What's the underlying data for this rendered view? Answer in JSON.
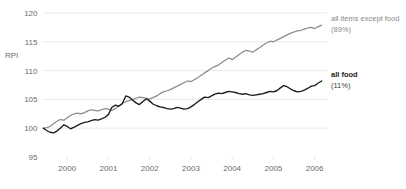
{
  "chart_data": {
    "type": "line",
    "title": "",
    "xlabel": "",
    "ylabel": "RPI",
    "ylim": [
      95,
      120
    ],
    "yticks": [
      95,
      100,
      105,
      110,
      115,
      120
    ],
    "ytick_labels": [
      "95",
      "100",
      "105",
      "110",
      "115",
      "120"
    ],
    "grid": true,
    "grid_axis": "y",
    "xlim": [
      1999.4,
      2006.3
    ],
    "xticks": [
      2000,
      2001,
      2002,
      2003,
      2004,
      2005,
      2006
    ],
    "xtick_labels": [
      "2000",
      "2001",
      "2002",
      "2003",
      "2004",
      "2005",
      "2006"
    ],
    "legend_position": "right-inline",
    "series": [
      {
        "name": "all items except food",
        "sublabel": "(89%)",
        "color": "#8c8c8c",
        "emphasis": false,
        "x": [
          1999.42,
          1999.5,
          1999.58,
          1999.67,
          1999.75,
          1999.83,
          1999.92,
          2000.0,
          2000.08,
          2000.17,
          2000.25,
          2000.33,
          2000.42,
          2000.5,
          2000.58,
          2000.67,
          2000.75,
          2000.83,
          2000.92,
          2001.0,
          2001.08,
          2001.17,
          2001.25,
          2001.33,
          2001.42,
          2001.5,
          2001.58,
          2001.67,
          2001.75,
          2001.83,
          2001.92,
          2002.0,
          2002.08,
          2002.17,
          2002.25,
          2002.33,
          2002.42,
          2002.5,
          2002.58,
          2002.67,
          2002.75,
          2002.83,
          2002.92,
          2003.0,
          2003.08,
          2003.17,
          2003.25,
          2003.33,
          2003.42,
          2003.5,
          2003.58,
          2003.67,
          2003.75,
          2003.83,
          2003.92,
          2004.0,
          2004.08,
          2004.17,
          2004.25,
          2004.33,
          2004.42,
          2004.5,
          2004.58,
          2004.67,
          2004.75,
          2004.83,
          2004.92,
          2005.0,
          2005.08,
          2005.17,
          2005.25,
          2005.33,
          2005.42,
          2005.5,
          2005.58,
          2005.67,
          2005.75,
          2005.83,
          2005.92,
          2006.0,
          2006.08,
          2006.17
        ],
        "y": [
          100.0,
          100.1,
          100.3,
          100.8,
          101.2,
          101.5,
          101.4,
          101.8,
          102.2,
          102.5,
          102.6,
          102.5,
          102.7,
          103.0,
          103.2,
          103.1,
          103.0,
          103.2,
          103.4,
          103.3,
          103.1,
          103.4,
          103.9,
          104.3,
          104.6,
          104.8,
          105.0,
          105.2,
          105.4,
          105.3,
          105.2,
          105.1,
          105.3,
          105.6,
          106.0,
          106.3,
          106.5,
          106.7,
          107.0,
          107.3,
          107.6,
          107.9,
          108.2,
          108.1,
          108.4,
          108.8,
          109.2,
          109.6,
          110.0,
          110.4,
          110.7,
          111.0,
          111.4,
          111.8,
          112.2,
          111.9,
          112.3,
          112.8,
          113.2,
          113.5,
          113.4,
          113.2,
          113.6,
          114.0,
          114.4,
          114.8,
          115.1,
          115.0,
          115.3,
          115.6,
          115.9,
          116.2,
          116.5,
          116.7,
          116.9,
          117.0,
          117.2,
          117.4,
          117.5,
          117.3,
          117.6,
          117.9
        ]
      },
      {
        "name": "all food",
        "sublabel": "(11%)",
        "color": "#1a1a1a",
        "emphasis": true,
        "x": [
          1999.42,
          1999.5,
          1999.58,
          1999.67,
          1999.75,
          1999.83,
          1999.92,
          2000.0,
          2000.08,
          2000.17,
          2000.25,
          2000.33,
          2000.42,
          2000.5,
          2000.58,
          2000.67,
          2000.75,
          2000.83,
          2000.92,
          2001.0,
          2001.08,
          2001.17,
          2001.25,
          2001.33,
          2001.42,
          2001.5,
          2001.58,
          2001.67,
          2001.75,
          2001.83,
          2001.92,
          2002.0,
          2002.08,
          2002.17,
          2002.25,
          2002.33,
          2002.42,
          2002.5,
          2002.58,
          2002.67,
          2002.75,
          2002.83,
          2002.92,
          2003.0,
          2003.08,
          2003.17,
          2003.25,
          2003.33,
          2003.42,
          2003.5,
          2003.58,
          2003.67,
          2003.75,
          2003.83,
          2003.92,
          2004.0,
          2004.08,
          2004.17,
          2004.25,
          2004.33,
          2004.42,
          2004.5,
          2004.58,
          2004.67,
          2004.75,
          2004.83,
          2004.92,
          2005.0,
          2005.08,
          2005.17,
          2005.25,
          2005.33,
          2005.42,
          2005.5,
          2005.58,
          2005.67,
          2005.75,
          2005.83,
          2005.92,
          2006.0,
          2006.08,
          2006.17
        ],
        "y": [
          100.0,
          99.6,
          99.3,
          99.2,
          99.5,
          100.0,
          100.6,
          100.3,
          99.9,
          100.2,
          100.5,
          100.8,
          101.0,
          101.1,
          101.3,
          101.5,
          101.4,
          101.6,
          101.9,
          102.4,
          103.6,
          104.0,
          103.8,
          104.2,
          105.6,
          105.4,
          104.9,
          104.4,
          104.1,
          104.6,
          105.1,
          104.7,
          104.2,
          103.9,
          103.7,
          103.6,
          103.4,
          103.3,
          103.4,
          103.6,
          103.5,
          103.3,
          103.4,
          103.7,
          104.1,
          104.6,
          105.0,
          105.4,
          105.3,
          105.6,
          105.9,
          106.1,
          106.0,
          106.2,
          106.4,
          106.3,
          106.2,
          106.0,
          105.9,
          106.0,
          105.8,
          105.7,
          105.8,
          105.9,
          106.0,
          106.2,
          106.4,
          106.3,
          106.5,
          107.0,
          107.4,
          107.2,
          106.8,
          106.5,
          106.3,
          106.4,
          106.6,
          106.9,
          107.3,
          107.4,
          107.8,
          108.2
        ]
      }
    ]
  },
  "axis": {
    "y_title": "RPI"
  }
}
